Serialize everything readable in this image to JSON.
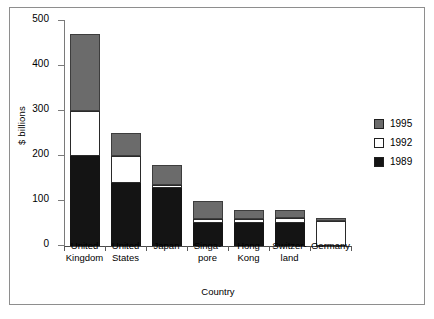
{
  "chart_data": {
    "type": "bar",
    "subtype": "stacked",
    "title": "",
    "xlabel": "Country",
    "ylabel": "$ billions",
    "ylim": [
      0,
      500
    ],
    "yticks": [
      0,
      100,
      200,
      300,
      400,
      500
    ],
    "ytick_labels": [
      "0",
      "100",
      "200",
      "300",
      "400",
      "500"
    ],
    "grid": false,
    "legend_position": "right",
    "categories": [
      "United Kingdom",
      "United States",
      "Japan",
      "Singapore",
      "Hong Kong",
      "Switzerland",
      "Germany"
    ],
    "category_lines": [
      [
        "United",
        "Kingdom"
      ],
      [
        "United",
        "States"
      ],
      [
        "Japan",
        ""
      ],
      [
        "Singa-",
        "pore"
      ],
      [
        "Hong",
        "Kong"
      ],
      [
        "Switzer-",
        "land"
      ],
      [
        "Germany",
        ""
      ]
    ],
    "series": [
      {
        "name": "1989",
        "color": "#141414",
        "values": [
          200,
          140,
          128,
          52,
          52,
          52,
          0
        ]
      },
      {
        "name": "1992",
        "color": "#ffffff",
        "values": [
          100,
          60,
          7,
          8,
          8,
          10,
          55
        ]
      },
      {
        "name": "1995",
        "color": "#6b6b6b",
        "values": [
          172,
          52,
          45,
          40,
          20,
          18,
          8
        ]
      }
    ],
    "totals": [
      472,
      252,
      180,
      100,
      80,
      80,
      63
    ]
  },
  "legend": {
    "entries": [
      {
        "label": "1995",
        "color": "#6b6b6b"
      },
      {
        "label": "1992",
        "color": "#ffffff"
      },
      {
        "label": "1989",
        "color": "#141414"
      }
    ]
  },
  "axes": {
    "y_title": "$ billions",
    "x_title": "Country"
  }
}
